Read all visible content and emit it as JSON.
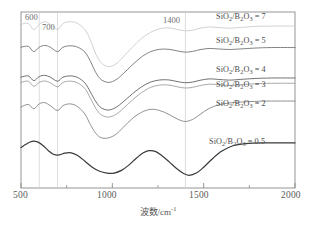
{
  "chart_data": {
    "type": "line",
    "title": "",
    "xlabel": "波数/cm⁻¹",
    "xlabel_base": "波数/cm",
    "xlabel_sup": "-1",
    "ylabel": "",
    "xlim": [
      500,
      2000
    ],
    "ylim": [
      0,
      1
    ],
    "grid": false,
    "legend_position": "inline-right",
    "xticks": [
      500,
      1000,
      1500,
      2000
    ],
    "xtick_labels": [
      "500",
      "1000",
      "1500",
      "2000"
    ],
    "minor_xticks": [
      750,
      1250,
      1750
    ],
    "annotations": [
      {
        "text": "600",
        "x": 600,
        "note": "vertical guide line at 600 cm-1"
      },
      {
        "text": "700",
        "x": 700,
        "note": "vertical guide line at 700 cm-1"
      },
      {
        "text": "1400",
        "x": 1400,
        "note": "vertical guide line at 1400 cm-1"
      }
    ],
    "guide_lines_x": [
      600,
      700,
      1400
    ],
    "series": [
      {
        "name": "SiO2/B2O3 = 7",
        "label_prefix": "SiO",
        "label_sub1": "2",
        "label_mid": "/B",
        "label_sub2": "2",
        "label_mid2": "O",
        "label_sub3": "3",
        "label_value": " = 7",
        "color": "#c9c9c9",
        "x": [
          500,
          540,
          570,
          600,
          630,
          660,
          700,
          730,
          770,
          810,
          850,
          880,
          910,
          940,
          980,
          1020,
          1060,
          1110,
          1160,
          1210,
          1260,
          1310,
          1360,
          1400,
          1440,
          1480,
          1530,
          1580,
          1640,
          1700,
          1780,
          1870,
          2000
        ],
        "y": [
          0.93,
          0.935,
          0.9,
          0.93,
          0.945,
          0.93,
          0.9,
          0.935,
          0.945,
          0.935,
          0.9,
          0.84,
          0.76,
          0.71,
          0.69,
          0.705,
          0.745,
          0.8,
          0.85,
          0.885,
          0.905,
          0.91,
          0.9,
          0.893,
          0.897,
          0.908,
          0.915,
          0.912,
          0.908,
          0.912,
          0.918,
          0.92,
          0.92
        ]
      },
      {
        "name": "SiO2/B2O3 = 5",
        "label_value": " = 5",
        "color": "#6b6b6b",
        "x": [
          500,
          540,
          570,
          600,
          630,
          660,
          700,
          730,
          770,
          810,
          850,
          880,
          910,
          940,
          980,
          1020,
          1060,
          1110,
          1160,
          1210,
          1260,
          1310,
          1360,
          1400,
          1440,
          1480,
          1530,
          1580,
          1640,
          1700,
          1780,
          1870,
          2000
        ],
        "y": [
          0.8,
          0.805,
          0.775,
          0.8,
          0.81,
          0.8,
          0.775,
          0.8,
          0.808,
          0.8,
          0.772,
          0.72,
          0.655,
          0.615,
          0.6,
          0.615,
          0.65,
          0.7,
          0.745,
          0.775,
          0.788,
          0.788,
          0.778,
          0.772,
          0.776,
          0.786,
          0.793,
          0.79,
          0.787,
          0.79,
          0.795,
          0.798,
          0.798
        ]
      },
      {
        "name": "SiO2/B2O3 = 4",
        "label_value": " = 4",
        "color": "#585858",
        "x": [
          500,
          540,
          570,
          600,
          630,
          660,
          700,
          730,
          770,
          810,
          850,
          880,
          910,
          940,
          980,
          1020,
          1060,
          1110,
          1160,
          1210,
          1260,
          1310,
          1360,
          1400,
          1440,
          1480,
          1530,
          1580,
          1640,
          1700,
          1780,
          1870,
          2000
        ],
        "y": [
          0.63,
          0.637,
          0.61,
          0.633,
          0.64,
          0.63,
          0.607,
          0.63,
          0.637,
          0.628,
          0.597,
          0.545,
          0.49,
          0.455,
          0.443,
          0.458,
          0.49,
          0.535,
          0.575,
          0.602,
          0.614,
          0.614,
          0.604,
          0.598,
          0.602,
          0.612,
          0.62,
          0.617,
          0.613,
          0.617,
          0.622,
          0.625,
          0.625
        ]
      },
      {
        "name": "SiO2/B2O3 = 3",
        "label_value": " = 3",
        "color": "#9a9a9a",
        "x": [
          500,
          540,
          570,
          600,
          630,
          660,
          700,
          730,
          770,
          810,
          850,
          880,
          910,
          940,
          980,
          1020,
          1060,
          1110,
          1160,
          1210,
          1260,
          1310,
          1360,
          1400,
          1440,
          1480,
          1530,
          1580,
          1640,
          1700,
          1780,
          1870,
          2000
        ],
        "y": [
          0.6,
          0.607,
          0.578,
          0.6,
          0.608,
          0.598,
          0.575,
          0.6,
          0.607,
          0.597,
          0.565,
          0.51,
          0.452,
          0.415,
          0.403,
          0.418,
          0.452,
          0.5,
          0.542,
          0.572,
          0.585,
          0.585,
          0.574,
          0.568,
          0.572,
          0.582,
          0.59,
          0.587,
          0.583,
          0.587,
          0.592,
          0.595,
          0.595
        ]
      },
      {
        "name": "SiO2/B2O3 = 2",
        "label_value": " = 2",
        "color": "#7d7d7d",
        "x": [
          500,
          540,
          570,
          600,
          630,
          660,
          700,
          730,
          770,
          810,
          850,
          880,
          910,
          940,
          980,
          1020,
          1060,
          1110,
          1160,
          1210,
          1260,
          1310,
          1360,
          1400,
          1440,
          1480,
          1530,
          1580,
          1640,
          1700,
          1780,
          1870,
          2000
        ],
        "y": [
          0.46,
          0.475,
          0.45,
          0.478,
          0.485,
          0.468,
          0.44,
          0.468,
          0.478,
          0.462,
          0.42,
          0.36,
          0.31,
          0.285,
          0.285,
          0.305,
          0.345,
          0.395,
          0.43,
          0.447,
          0.44,
          0.418,
          0.39,
          0.378,
          0.39,
          0.418,
          0.452,
          0.472,
          0.483,
          0.488,
          0.492,
          0.494,
          0.494
        ]
      },
      {
        "name": "SiO2/B2O3 = 0.5",
        "label_value": " = 0.5",
        "color": "#3a3a3a",
        "x": [
          500,
          530,
          560,
          590,
          620,
          650,
          680,
          710,
          740,
          775,
          810,
          850,
          890,
          930,
          970,
          1010,
          1050,
          1090,
          1130,
          1170,
          1200,
          1235,
          1270,
          1310,
          1350,
          1390,
          1420,
          1460,
          1500,
          1550,
          1600,
          1660,
          1730,
          1820,
          2000
        ],
        "y": [
          0.23,
          0.25,
          0.265,
          0.262,
          0.242,
          0.212,
          0.19,
          0.188,
          0.198,
          0.2,
          0.185,
          0.152,
          0.118,
          0.095,
          0.085,
          0.085,
          0.1,
          0.13,
          0.168,
          0.2,
          0.212,
          0.208,
          0.185,
          0.15,
          0.112,
          0.082,
          0.072,
          0.085,
          0.118,
          0.168,
          0.21,
          0.24,
          0.252,
          0.256,
          0.256
        ]
      }
    ]
  },
  "labels": {
    "tick_500": "500",
    "tick_1000": "1000",
    "tick_1500": "1500",
    "tick_2000": "2000",
    "guide_600": "600",
    "guide_700": "700",
    "guide_1400": "1400",
    "xaxis_title_base": "波数/cm",
    "xaxis_title_sup": "-1",
    "series_7": " = 7",
    "series_5": " = 5",
    "series_4": " = 4",
    "series_3": " = 3",
    "series_2": " = 2",
    "series_05": " = 0.5",
    "formula_a": "SiO",
    "formula_sub2a": "2",
    "formula_slash_b": "/B",
    "formula_sub2b": "2",
    "formula_o": "O",
    "formula_sub3": "3"
  },
  "colors": {
    "frame": "#8a8a8a",
    "guide": "#cfcfcf",
    "text": "#4a4a4a",
    "background": "#ffffff"
  }
}
